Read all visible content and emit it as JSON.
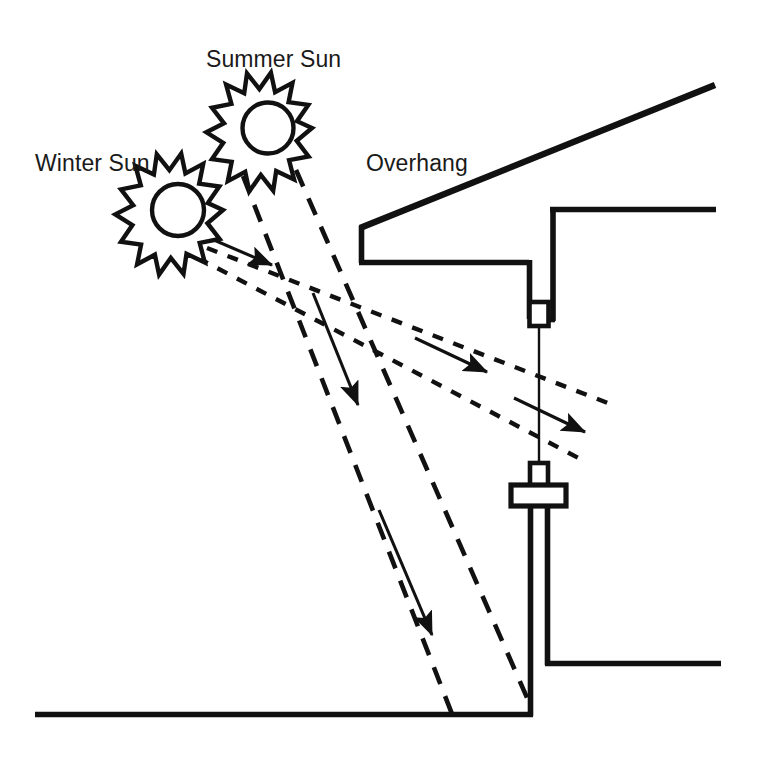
{
  "diagram": {
    "type": "architectural-section",
    "stroke_color": "#111111",
    "background_color": "#ffffff",
    "labels": {
      "winter_sun": "Winter Sun",
      "summer_sun": "Summer Sun",
      "overhang": "Overhang"
    },
    "icons": {
      "winter_sun": "sun-starburst-icon",
      "summer_sun": "sun-starburst-icon"
    },
    "suns": [
      {
        "name": "winter-sun",
        "label": "Winter Sun",
        "cx": 178,
        "cy": 210,
        "outer_radius": 45,
        "inner_radius": 32,
        "core_radius": 20,
        "points": 16
      },
      {
        "name": "summer-sun",
        "label": "Summer Sun",
        "cx": 268,
        "cy": 128,
        "outer_radius": 44,
        "inner_radius": 31,
        "core_radius": 19,
        "points": 16
      }
    ],
    "building": {
      "roof_line": {
        "x1": 360,
        "y1": 228,
        "x2": 715,
        "y2": 85
      },
      "fascia": {
        "x1": 360,
        "y1": 228,
        "x2": 360,
        "y2": 262
      },
      "soffit": {
        "x1": 360,
        "y1": 262,
        "x2": 528,
        "y2": 262
      },
      "window_head_drop": {
        "x1": 528,
        "y1": 262,
        "x2": 528,
        "y2": 318
      },
      "header_bottom": {
        "x1": 528,
        "y1": 318,
        "x2": 553,
        "y2": 318
      },
      "interior_wall_upper": {
        "x1": 553,
        "y1": 318,
        "x2": 553,
        "y2": 207
      },
      "ceiling": {
        "x1": 553,
        "y1": 207,
        "x2": 715,
        "y2": 207
      },
      "glazing": {
        "x1": 538,
        "y1": 325,
        "x2": 538,
        "y2": 470
      },
      "head_jamb": {
        "x": 528,
        "y": 300,
        "w": 20,
        "h": 25
      },
      "sill_neck": {
        "x": 530,
        "y": 464,
        "w": 16,
        "h": 20
      },
      "sill_plate": {
        "x": 512,
        "y": 484,
        "w": 53,
        "h": 20
      },
      "exterior_wall": {
        "x1": 530,
        "y1": 504,
        "x2": 530,
        "y2": 714
      },
      "interior_wall_lower": {
        "x1": 548,
        "y1": 504,
        "x2": 548,
        "y2": 663
      },
      "floor": {
        "x1": 548,
        "y1": 663,
        "x2": 720,
        "y2": 663
      },
      "ground": {
        "x1": 35,
        "y1": 714,
        "x2": 533,
        "y2": 714
      }
    },
    "rays": {
      "summer": {
        "style": "long-dash",
        "dash_pattern": "18 13",
        "angle_description": "steep high-altitude sun blocked by overhang",
        "lines": [
          {
            "x1": 243,
            "y1": 176,
            "x2": 452,
            "y2": 714
          },
          {
            "x1": 296,
            "y1": 170,
            "x2": 528,
            "y2": 700
          }
        ],
        "arrows": [
          {
            "x1": 313,
            "y1": 293,
            "x2": 358,
            "y2": 405
          },
          {
            "x1": 379,
            "y1": 510,
            "x2": 432,
            "y2": 635
          }
        ]
      },
      "winter": {
        "style": "short-dot",
        "dash_pattern": "11 11",
        "angle_description": "low-altitude sun passes under overhang into window",
        "lines": [
          {
            "x1": 207,
            "y1": 248,
            "x2": 613,
            "y2": 405
          },
          {
            "x1": 198,
            "y1": 258,
            "x2": 586,
            "y2": 462
          }
        ],
        "arrows": [
          {
            "x1": 193,
            "y1": 231,
            "x2": 272,
            "y2": 265
          },
          {
            "x1": 415,
            "y1": 338,
            "x2": 487,
            "y2": 372
          },
          {
            "x1": 514,
            "y1": 398,
            "x2": 585,
            "y2": 432
          }
        ]
      }
    }
  }
}
